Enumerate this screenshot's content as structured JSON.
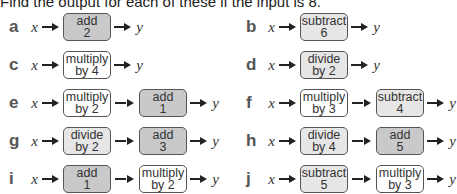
{
  "title": "Find the output for each of these if the input is 8.",
  "input_label": "x",
  "output_label": "y",
  "colors": {
    "add_fill": "#c9c9c9",
    "subtract_divide_fill": "#e6e6e6",
    "multiply_fill": "#ffffff",
    "border": "#555555"
  },
  "problems": [
    {
      "letter": "a",
      "steps": [
        {
          "op": "add",
          "value": "2"
        }
      ]
    },
    {
      "letter": "b",
      "steps": [
        {
          "op": "subtract",
          "value": "6"
        }
      ]
    },
    {
      "letter": "c",
      "steps": [
        {
          "op": "multiply",
          "value": "by 4"
        }
      ]
    },
    {
      "letter": "d",
      "steps": [
        {
          "op": "divide",
          "value": "by 2"
        }
      ]
    },
    {
      "letter": "e",
      "steps": [
        {
          "op": "multiply",
          "value": "by 2"
        },
        {
          "op": "add",
          "value": "1"
        }
      ]
    },
    {
      "letter": "f",
      "steps": [
        {
          "op": "multiply",
          "value": "by 3"
        },
        {
          "op": "subtract",
          "value": "4"
        }
      ]
    },
    {
      "letter": "g",
      "steps": [
        {
          "op": "divide",
          "value": "by 2"
        },
        {
          "op": "add",
          "value": "3"
        }
      ]
    },
    {
      "letter": "h",
      "steps": [
        {
          "op": "divide",
          "value": "by 4"
        },
        {
          "op": "add",
          "value": "5"
        }
      ]
    },
    {
      "letter": "i",
      "steps": [
        {
          "op": "add",
          "value": "1"
        },
        {
          "op": "multiply",
          "value": "by 2"
        }
      ]
    },
    {
      "letter": "j",
      "steps": [
        {
          "op": "subtract",
          "value": "5"
        },
        {
          "op": "multiply",
          "value": "by 3"
        }
      ]
    }
  ]
}
